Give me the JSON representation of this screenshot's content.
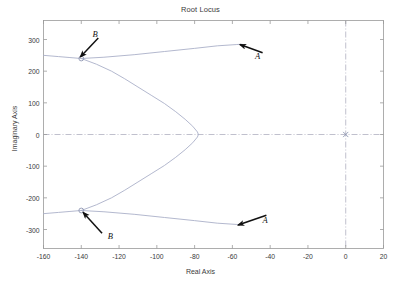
{
  "chart_data": {
    "type": "line",
    "title": "Root Locus",
    "xlabel": "Real Axis",
    "ylabel": "Imaginary Axis",
    "xlim": [
      -160,
      20
    ],
    "ylim": [
      -360,
      360
    ],
    "xticks": [
      -160,
      -140,
      -120,
      -100,
      -80,
      -60,
      -40,
      -20,
      0,
      20
    ],
    "xticklabels": [
      "-160",
      "-140",
      "-120",
      "-100",
      "-80",
      "-60",
      "-40",
      "-20",
      "0",
      "20"
    ],
    "yticks": [
      300,
      200,
      100,
      0,
      -100,
      -200,
      -300
    ],
    "yticklabels": [
      "300",
      "200",
      "100",
      "0",
      "-100",
      "-200",
      "-300"
    ],
    "grid": false,
    "legend": "none",
    "axis_lines": {
      "x_zero": 0,
      "y_zero": 0,
      "style": "dash-dot",
      "color": "#b0b0c0"
    },
    "locus_color": "#aab0c8",
    "markers": [
      {
        "name": "zero-upper",
        "symbol": "open-circle",
        "x": -140,
        "y": 240
      },
      {
        "name": "zero-lower",
        "symbol": "open-circle",
        "x": -140,
        "y": -240
      },
      {
        "name": "pole-origin",
        "symbol": "cross",
        "x": 0,
        "y": 0
      }
    ],
    "series": [
      {
        "name": "upper-branch-outer",
        "points": [
          [
            -160,
            250
          ],
          [
            -152,
            246
          ],
          [
            -146,
            243
          ],
          [
            -140,
            240
          ],
          [
            -128,
            244
          ],
          [
            -112,
            252
          ],
          [
            -96,
            262
          ],
          [
            -80,
            272
          ],
          [
            -68,
            280
          ],
          [
            -58,
            284
          ],
          [
            -55,
            285
          ]
        ]
      },
      {
        "name": "upper-branch-inner",
        "points": [
          [
            -140,
            240
          ],
          [
            -132,
            222
          ],
          [
            -124,
            200
          ],
          [
            -117,
            176
          ],
          [
            -110,
            150
          ],
          [
            -103,
            124
          ],
          [
            -96,
            98
          ],
          [
            -90,
            72
          ],
          [
            -85,
            48
          ],
          [
            -81,
            26
          ],
          [
            -78.5,
            8
          ],
          [
            -78,
            0
          ]
        ]
      },
      {
        "name": "lower-branch-inner",
        "points": [
          [
            -78,
            0
          ],
          [
            -78.5,
            -8
          ],
          [
            -81,
            -26
          ],
          [
            -85,
            -48
          ],
          [
            -90,
            -72
          ],
          [
            -96,
            -98
          ],
          [
            -103,
            -124
          ],
          [
            -110,
            -150
          ],
          [
            -117,
            -176
          ],
          [
            -124,
            -200
          ],
          [
            -132,
            -222
          ],
          [
            -140,
            -240
          ]
        ]
      },
      {
        "name": "lower-branch-outer",
        "points": [
          [
            -140,
            -240
          ],
          [
            -128,
            -244
          ],
          [
            -112,
            -252
          ],
          [
            -96,
            -262
          ],
          [
            -80,
            -272
          ],
          [
            -68,
            -280
          ],
          [
            -58,
            -284
          ],
          [
            -55,
            -285
          ]
        ]
      },
      {
        "name": "lower-branch-left-tail",
        "points": [
          [
            -160,
            -250
          ],
          [
            -152,
            -246
          ],
          [
            -146,
            -243
          ],
          [
            -140,
            -240
          ]
        ]
      }
    ],
    "annotations": [
      {
        "label": "A",
        "label_x": -48,
        "label_y": 248,
        "tip_x": -56,
        "tip_y": 284,
        "tail_x": -44,
        "tail_y": 258
      },
      {
        "label": "B",
        "label_x": -134,
        "label_y": 316,
        "tip_x": -140.5,
        "tip_y": 245,
        "tail_x": -131,
        "tail_y": 305
      },
      {
        "label": "A",
        "label_x": -44,
        "label_y": -270,
        "tip_x": -57,
        "tip_y": -286,
        "tail_x": -42,
        "tail_y": -255
      },
      {
        "label": "B",
        "label_x": -126,
        "label_y": -322,
        "tip_x": -139,
        "tip_y": -246,
        "tail_x": -129,
        "tail_y": -312
      }
    ]
  }
}
